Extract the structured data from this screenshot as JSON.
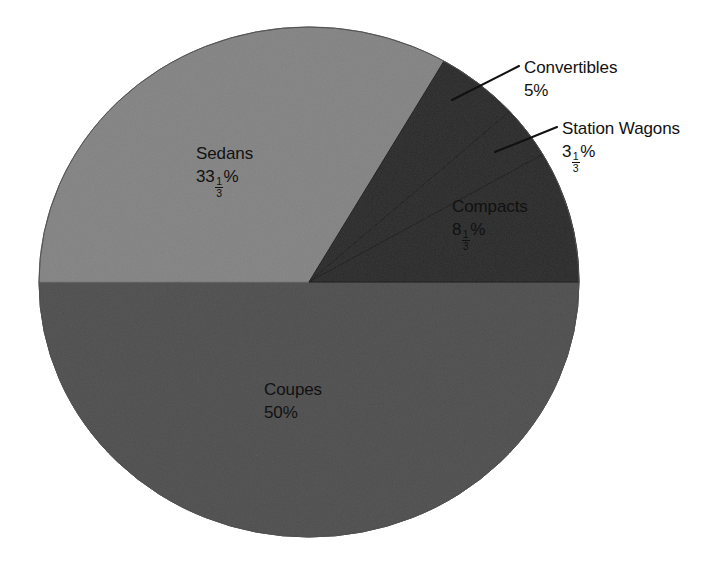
{
  "figure": {
    "background_color": "#ffffff",
    "text_color": "#111111"
  },
  "chart_data": {
    "type": "pie",
    "title": "",
    "subtitle": "",
    "xlabel": "",
    "ylabel": "",
    "legend_position": "none",
    "grid": false,
    "labels_inside": [
      "Sedans",
      "Coupes",
      "Compacts"
    ],
    "labels_outside": [
      "Convertibles",
      "Station Wagons"
    ],
    "categories": [
      "Sedans",
      "Convertibles",
      "Station Wagons",
      "Compacts",
      "Coupes"
    ],
    "values": [
      33.3333,
      5,
      3.3333,
      8.3333,
      50
    ],
    "value_labels": [
      "33 1/3%",
      "5%",
      "3 1/3%",
      "8 1/3%",
      "50%"
    ],
    "slices": [
      {
        "name": "Sedans",
        "value": 33.3333,
        "value_display": "33 1/3%",
        "whole": "33",
        "numerator": "1",
        "denominator": "3",
        "percent_sign": "%",
        "has_fraction": true,
        "color": "#b9b9b9",
        "label_placement": "inside",
        "leader_line": false
      },
      {
        "name": "Convertibles",
        "value": 5,
        "value_display": "5%",
        "whole": "5",
        "percent_sign": "%",
        "has_fraction": false,
        "color": "#6f6f6f",
        "label_placement": "outside",
        "leader_line": true
      },
      {
        "name": "Station Wagons",
        "value": 3.3333,
        "value_display": "3 1/3%",
        "whole": "3",
        "numerator": "1",
        "denominator": "3",
        "percent_sign": "%",
        "has_fraction": true,
        "color": "#6f6f6f",
        "label_placement": "outside",
        "leader_line": true
      },
      {
        "name": "Compacts",
        "value": 8.3333,
        "value_display": "8 1/3%",
        "whole": "8",
        "numerator": "1",
        "denominator": "3",
        "percent_sign": "%",
        "has_fraction": true,
        "color": "#6f6f6f",
        "label_placement": "inside",
        "leader_line": false
      },
      {
        "name": "Coupes",
        "value": 50,
        "value_display": "50%",
        "whole": "50",
        "percent_sign": "%",
        "has_fraction": false,
        "color": "#919191",
        "label_placement": "inside",
        "leader_line": false
      }
    ]
  }
}
